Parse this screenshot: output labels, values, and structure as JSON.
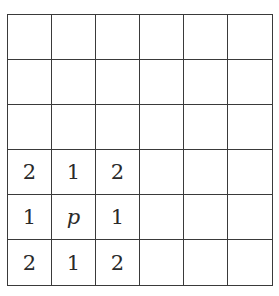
{
  "grid": {
    "rows": 6,
    "cols": 6,
    "cells": [
      [
        "",
        "",
        "",
        "",
        "",
        ""
      ],
      [
        "",
        "",
        "",
        "",
        "",
        ""
      ],
      [
        "",
        "",
        "",
        "",
        "",
        ""
      ],
      [
        "2",
        "1",
        "2",
        "",
        "",
        ""
      ],
      [
        "1",
        "p",
        "1",
        "",
        "",
        ""
      ],
      [
        "2",
        "1",
        "2",
        "",
        "",
        ""
      ]
    ],
    "italic_cells": [
      [
        4,
        1
      ]
    ],
    "line_color": "#3a3a3a"
  }
}
